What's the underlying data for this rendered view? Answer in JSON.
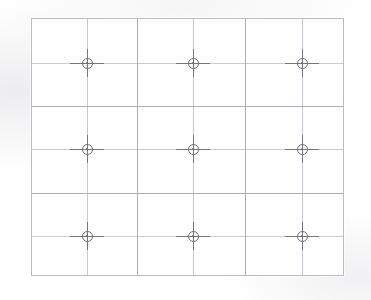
{
  "document": {
    "title": "Calibration Grid Target",
    "description": "Scanned rectangular calibration target with a 3x3 array of circular crosshair fiducial markers"
  },
  "canvas": {
    "width": 371,
    "height": 300,
    "background_color": "#ffffff"
  },
  "frame": {
    "name": "target-frame",
    "left": 31,
    "top": 18,
    "width": 313,
    "height": 258,
    "border_color": "#b9bcc6",
    "fill_color": "#fefeff"
  },
  "grid": {
    "line_color": "#a9adc4",
    "reference_line_color": "#c6c8d2",
    "columns": 3,
    "rows": 3,
    "vertical_division_lines_x": [
      105,
      213
    ],
    "horizontal_division_lines_y": [
      87,
      174
    ]
  },
  "markers": {
    "marker_color": "#75767f",
    "ring_diameter": 11,
    "arm_length_horizontal": 34,
    "arm_length_vertical": 28,
    "count": 9,
    "reference_lines_x": [
      55,
      161,
      270
    ],
    "reference_lines_y": [
      44,
      130,
      217
    ],
    "points": [
      {
        "id": "marker-r1-c1",
        "row": 1,
        "col": 1,
        "x": 55,
        "y": 44
      },
      {
        "id": "marker-r1-c2",
        "row": 1,
        "col": 2,
        "x": 161,
        "y": 44
      },
      {
        "id": "marker-r1-c3",
        "row": 1,
        "col": 3,
        "x": 270,
        "y": 44
      },
      {
        "id": "marker-r2-c1",
        "row": 2,
        "col": 1,
        "x": 55,
        "y": 130
      },
      {
        "id": "marker-r2-c2",
        "row": 2,
        "col": 2,
        "x": 161,
        "y": 130
      },
      {
        "id": "marker-r2-c3",
        "row": 2,
        "col": 3,
        "x": 270,
        "y": 130
      },
      {
        "id": "marker-r3-c1",
        "row": 3,
        "col": 1,
        "x": 55,
        "y": 217
      },
      {
        "id": "marker-r3-c2",
        "row": 3,
        "col": 2,
        "x": 161,
        "y": 217
      },
      {
        "id": "marker-r3-c3",
        "row": 3,
        "col": 3,
        "x": 270,
        "y": 217
      }
    ]
  }
}
